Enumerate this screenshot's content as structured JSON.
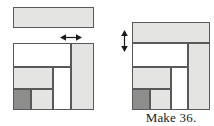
{
  "figure": {
    "kind": "quilt-block-assembly-diagram",
    "caption": "Make 36.",
    "colors": {
      "light": "#e4e4e2",
      "medium": "#b6b6b4",
      "dark": "#8d8d8b",
      "outline": "#595959",
      "background": "#ffffff",
      "text": "#1b1b1b"
    }
  },
  "strip": {
    "label": "border strip",
    "tone": "light"
  },
  "arrows": {
    "horizontal": {
      "name": "width-arrow",
      "direction": "double-horizontal"
    },
    "vertical": {
      "name": "height-arrow",
      "direction": "double-vertical"
    }
  },
  "left_block": {
    "label": "log cabin block before adding strip",
    "patches": [
      {
        "name": "top-band",
        "tone": "medium",
        "x": 0,
        "y": 0,
        "w": 58,
        "h": 24
      },
      {
        "name": "right-column",
        "tone": "light",
        "x": 58,
        "y": 0,
        "w": 23,
        "h": 67
      },
      {
        "name": "middle-left",
        "tone": "light",
        "x": 0,
        "y": 24,
        "w": 40,
        "h": 22
      },
      {
        "name": "middle-right",
        "tone": "medium",
        "x": 40,
        "y": 24,
        "w": 18,
        "h": 43
      },
      {
        "name": "corner-dark",
        "tone": "dark",
        "x": 0,
        "y": 46,
        "w": 18,
        "h": 21
      },
      {
        "name": "bottom-light",
        "tone": "light",
        "x": 18,
        "y": 46,
        "w": 22,
        "h": 21
      }
    ]
  },
  "right_block": {
    "label": "log cabin block after adding strip",
    "patches": [
      {
        "name": "top-strip",
        "tone": "light",
        "x": 0,
        "y": 0,
        "w": 78,
        "h": 21
      },
      {
        "name": "top-band",
        "tone": "medium",
        "x": 0,
        "y": 21,
        "w": 56,
        "h": 24
      },
      {
        "name": "right-column",
        "tone": "light",
        "x": 56,
        "y": 21,
        "w": 22,
        "h": 67
      },
      {
        "name": "middle-left",
        "tone": "light",
        "x": 0,
        "y": 45,
        "w": 39,
        "h": 22
      },
      {
        "name": "middle-right",
        "tone": "medium",
        "x": 39,
        "y": 45,
        "w": 17,
        "h": 43
      },
      {
        "name": "corner-dark",
        "tone": "dark",
        "x": 0,
        "y": 67,
        "w": 18,
        "h": 21
      },
      {
        "name": "bottom-light",
        "tone": "light",
        "x": 18,
        "y": 67,
        "w": 21,
        "h": 21
      }
    ]
  }
}
